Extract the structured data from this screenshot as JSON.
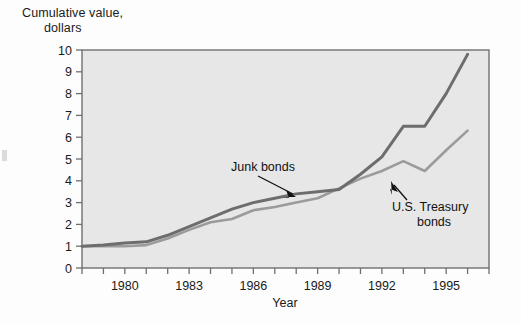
{
  "chart_data": {
    "type": "line",
    "title": "",
    "ylabel": "Cumulative value,\ndollars",
    "ylabel_line1": "Cumulative value,",
    "ylabel_line2": "dollars",
    "xlabel": "Year",
    "xlim": [
      1978,
      1997
    ],
    "ylim": [
      0,
      10
    ],
    "ytick_labels": [
      "0",
      "1",
      "2",
      "3",
      "4",
      "5",
      "6",
      "7",
      "8",
      "9",
      "10"
    ],
    "ytick_values": [
      0,
      1,
      2,
      3,
      4,
      5,
      6,
      7,
      8,
      9,
      10
    ],
    "xtick_labels": [
      "1980",
      "1983",
      "1986",
      "1989",
      "1992",
      "1995"
    ],
    "xtick_values": [
      1980,
      1983,
      1986,
      1989,
      1992,
      1995
    ],
    "grid": false,
    "legend_position": "annotations-inline",
    "x": [
      1978,
      1979,
      1980,
      1981,
      1982,
      1983,
      1984,
      1985,
      1986,
      1987,
      1988,
      1989,
      1990,
      1991,
      1992,
      1993,
      1994,
      1995,
      1996
    ],
    "series": [
      {
        "name": "Junk bonds",
        "color": "#6d6d6d",
        "annotation": "Junk bonds",
        "values": [
          1.0,
          1.05,
          1.15,
          1.2,
          1.5,
          1.9,
          2.3,
          2.7,
          3.0,
          3.2,
          3.4,
          3.5,
          3.6,
          4.3,
          5.1,
          6.5,
          6.5,
          8.0,
          9.8
        ]
      },
      {
        "name": "U.S. Treasury bonds",
        "color": "#9b9b9b",
        "annotation": "U.S. Treasury\nbonds",
        "annotation_line1": "U.S. Treasury",
        "annotation_line2": "bonds",
        "values": [
          1.0,
          1.0,
          1.0,
          1.05,
          1.35,
          1.75,
          2.1,
          2.25,
          2.65,
          2.8,
          3.0,
          3.2,
          3.65,
          4.1,
          4.45,
          4.9,
          4.45,
          5.4,
          6.3
        ]
      }
    ],
    "annotations": [
      {
        "text": "Junk bonds",
        "target_x": 1986.6,
        "target_y": 3.25
      },
      {
        "text": "U.S. Treasury bonds",
        "target_x": 1991.3,
        "target_y": 4.2
      }
    ],
    "colors": {
      "plot_background": "#e7e7e7",
      "frame": "#6f6f6f",
      "junk_bonds": "#6d6d6d",
      "treasury_bonds": "#9b9b9b",
      "text": "#1a1a1a"
    }
  }
}
